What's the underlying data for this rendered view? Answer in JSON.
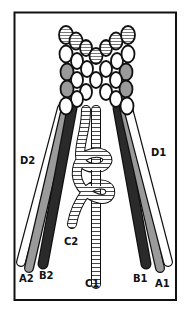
{
  "diagram": {
    "frame": {
      "x": 14.5,
      "y": 12.5,
      "w": 161.5,
      "h": 287.5,
      "stroke": "#111111"
    },
    "colors": {
      "outline": "#111111",
      "white": "#ffffff",
      "gray": "#9a9a9a",
      "dark": "#2a2a2a",
      "stripe": "#555555"
    },
    "labels": [
      {
        "id": "D2",
        "text": "D2",
        "x": 20,
        "y": 164
      },
      {
        "id": "D1",
        "text": "D1",
        "x": 151,
        "y": 156
      },
      {
        "id": "C2",
        "text": "C2",
        "x": 64,
        "y": 245
      },
      {
        "id": "C1",
        "text": "C1",
        "x": 85,
        "y": 287
      },
      {
        "id": "A2",
        "text": "A2",
        "x": 19,
        "y": 282
      },
      {
        "id": "B2",
        "text": "B2",
        "x": 39,
        "y": 279
      },
      {
        "id": "B1",
        "text": "B1",
        "x": 133,
        "y": 282
      },
      {
        "id": "A1",
        "text": "A1",
        "x": 155,
        "y": 287
      }
    ],
    "cords": [
      {
        "id": "D2",
        "fill": "#ffffff",
        "x1": 62,
        "y1": 108,
        "x2": 21,
        "y2": 262,
        "w": 8
      },
      {
        "id": "A2",
        "fill": "#9a9a9a",
        "x1": 66,
        "y1": 108,
        "x2": 29,
        "y2": 268,
        "w": 8
      },
      {
        "id": "B2",
        "fill": "#2a2a2a",
        "x1": 72,
        "y1": 108,
        "x2": 43,
        "y2": 264,
        "w": 9
      },
      {
        "id": "B1",
        "fill": "#2a2a2a",
        "x1": 118,
        "y1": 108,
        "x2": 146,
        "y2": 264,
        "w": 9
      },
      {
        "id": "A1",
        "fill": "#9a9a9a",
        "x1": 124,
        "y1": 108,
        "x2": 160,
        "y2": 268,
        "w": 8
      },
      {
        "id": "D1",
        "fill": "#ffffff",
        "x1": 128,
        "y1": 108,
        "x2": 168,
        "y2": 262,
        "w": 8
      }
    ],
    "beads": [
      {
        "cx": 66,
        "cy": 35,
        "rx": 7,
        "ry": 9,
        "fill": "stripe"
      },
      {
        "cx": 76,
        "cy": 41,
        "rx": 6.5,
        "ry": 8.5,
        "fill": "stripe"
      },
      {
        "cx": 86,
        "cy": 48,
        "rx": 6,
        "ry": 8,
        "fill": "stripe"
      },
      {
        "cx": 96,
        "cy": 56,
        "rx": 6.5,
        "ry": 8,
        "fill": "stripe"
      },
      {
        "cx": 106,
        "cy": 48,
        "rx": 6,
        "ry": 8,
        "fill": "stripe"
      },
      {
        "cx": 116,
        "cy": 41,
        "rx": 6.5,
        "ry": 8.5,
        "fill": "stripe"
      },
      {
        "cx": 128,
        "cy": 35,
        "rx": 7,
        "ry": 9,
        "fill": "stripe"
      },
      {
        "cx": 66,
        "cy": 54,
        "rx": 6.5,
        "ry": 8.5,
        "fill": "white"
      },
      {
        "cx": 77,
        "cy": 61,
        "rx": 6,
        "ry": 8,
        "fill": "white"
      },
      {
        "cx": 87,
        "cy": 69,
        "rx": 6,
        "ry": 8,
        "fill": "white"
      },
      {
        "cx": 106,
        "cy": 69,
        "rx": 6,
        "ry": 8,
        "fill": "white"
      },
      {
        "cx": 117,
        "cy": 61,
        "rx": 6,
        "ry": 8,
        "fill": "white"
      },
      {
        "cx": 128,
        "cy": 54,
        "rx": 6.5,
        "ry": 8.5,
        "fill": "white"
      },
      {
        "cx": 67,
        "cy": 72,
        "rx": 6.5,
        "ry": 8.5,
        "fill": "gray"
      },
      {
        "cx": 126,
        "cy": 72,
        "rx": 6.5,
        "ry": 8.5,
        "fill": "gray"
      },
      {
        "cx": 96,
        "cy": 80,
        "rx": 6,
        "ry": 8,
        "fill": "white"
      },
      {
        "cx": 77,
        "cy": 80,
        "rx": 6,
        "ry": 8,
        "fill": "white"
      },
      {
        "cx": 116,
        "cy": 80,
        "rx": 6,
        "ry": 8,
        "fill": "white"
      },
      {
        "cx": 67,
        "cy": 89,
        "rx": 6.5,
        "ry": 8.5,
        "fill": "gray"
      },
      {
        "cx": 126,
        "cy": 89,
        "rx": 6.5,
        "ry": 8.5,
        "fill": "gray"
      },
      {
        "cx": 86,
        "cy": 92,
        "rx": 6,
        "ry": 8,
        "fill": "white"
      },
      {
        "cx": 106,
        "cy": 92,
        "rx": 6,
        "ry": 8,
        "fill": "white"
      },
      {
        "cx": 77,
        "cy": 99,
        "rx": 6,
        "ry": 8,
        "fill": "white"
      },
      {
        "cx": 116,
        "cy": 99,
        "rx": 6,
        "ry": 8,
        "fill": "white"
      },
      {
        "cx": 66,
        "cy": 106,
        "rx": 6.5,
        "ry": 8.5,
        "fill": "white"
      },
      {
        "cx": 127,
        "cy": 106,
        "rx": 6.5,
        "ry": 8.5,
        "fill": "white"
      }
    ]
  }
}
